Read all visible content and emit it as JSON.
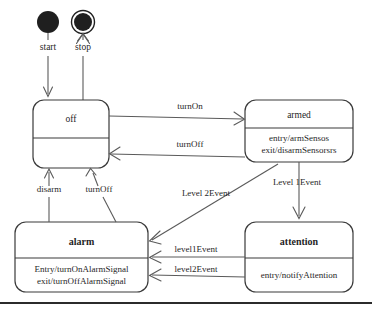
{
  "diagram": {
    "kind": "uml-state-machine",
    "title": "",
    "canvas": {
      "width": 372,
      "height": 312,
      "background": "#ffffff"
    },
    "colors": {
      "box_stroke": "#3a3a3a",
      "box_fill": "#ffffff",
      "edge_stroke": "#5a5a5a",
      "text": "#1f1f1f",
      "pseudostate_fill": "#1f1f1f",
      "bottom_rule": "#2b2b2b"
    },
    "pseudostates": [
      {
        "id": "initial",
        "type": "initial-state",
        "label": "start",
        "cx": 48,
        "cy": 22,
        "r": 11,
        "label_x": 48,
        "label_y": 50
      },
      {
        "id": "final",
        "type": "final-state",
        "label": "stop",
        "cx": 83,
        "cy": 22,
        "r": 9,
        "outer_r": 12,
        "label_x": 83,
        "label_y": 50
      }
    ],
    "states": [
      {
        "id": "off",
        "name": "off",
        "bold": false,
        "x": 33,
        "y": 100,
        "width": 76,
        "height": 68,
        "rx": 11,
        "divider_y": 138,
        "actions": []
      },
      {
        "id": "armed",
        "name": "armed",
        "bold": false,
        "x": 245,
        "y": 100,
        "width": 108,
        "height": 62,
        "rx": 11,
        "divider_y": 128,
        "actions": [
          "entry/armSensos",
          "exit/disarmSensorsrs"
        ]
      },
      {
        "id": "alarm",
        "name": "alarm",
        "bold": true,
        "x": 15,
        "y": 222,
        "width": 133,
        "height": 70,
        "rx": 11,
        "divider_y": 258,
        "actions": [
          "Entry/turnOnAlarmSignal",
          "exit/turnOffAlarmSignal"
        ]
      },
      {
        "id": "attention",
        "name": "attention",
        "bold": true,
        "x": 245,
        "y": 222,
        "width": 108,
        "height": 70,
        "rx": 11,
        "divider_y": 258,
        "actions": [
          "entry/notifyAttention"
        ]
      }
    ],
    "transitions": [
      {
        "id": "t-start-off",
        "from": "initial",
        "to": "off",
        "label": "",
        "label_x": 0,
        "label_y": 0
      },
      {
        "id": "t-off-stop",
        "from": "off",
        "to": "final",
        "label": "",
        "label_x": 0,
        "label_y": 0
      },
      {
        "id": "t-off-armed",
        "from": "off",
        "to": "armed",
        "label": "turnOn",
        "label_x": 190,
        "label_y": 109
      },
      {
        "id": "t-armed-off",
        "from": "armed",
        "to": "off",
        "label": "turnOff",
        "label_x": 190,
        "label_y": 147
      },
      {
        "id": "t-armed-attention",
        "from": "armed",
        "to": "attention",
        "label": "Level 1Event",
        "label_x": 297,
        "label_y": 187
      },
      {
        "id": "t-armed-alarm",
        "from": "armed",
        "to": "alarm",
        "label": "Level 2Event",
        "label_x": 206,
        "label_y": 198
      },
      {
        "id": "t-attention-alarm-1",
        "from": "attention",
        "to": "alarm",
        "label": "level1Event",
        "label_x": 196,
        "label_y": 251
      },
      {
        "id": "t-attention-alarm-2",
        "from": "attention",
        "to": "alarm",
        "label": "level2Event",
        "label_x": 196,
        "label_y": 274
      },
      {
        "id": "t-alarm-off-disarm",
        "from": "alarm",
        "to": "off",
        "label": "disarm",
        "label_x": 49,
        "label_y": 192
      },
      {
        "id": "t-alarm-off-turnoff",
        "from": "alarm",
        "to": "off",
        "label": "turnOff",
        "label_x": 97,
        "label_y": 192
      }
    ],
    "bottom_rule": {
      "x1": 0,
      "y1": 303,
      "x2": 372,
      "y2": 303
    }
  }
}
